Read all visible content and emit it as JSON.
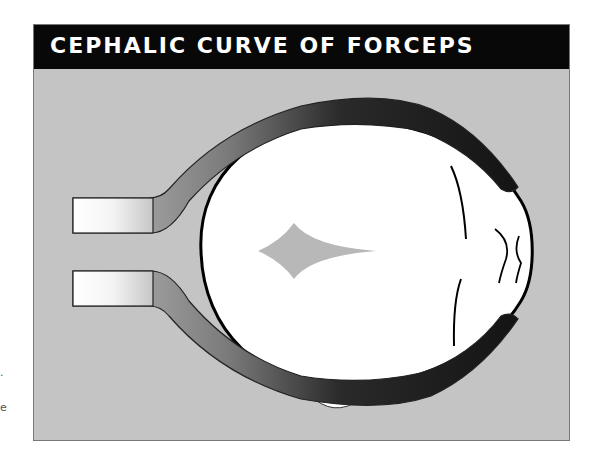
{
  "diagram": {
    "title": "CEPHALIC CURVE OF FORCEPS",
    "parts": {
      "head": "fetal head (top view)",
      "fontanelle": "anterior fontanelle",
      "blade_upper": "upper forceps blade",
      "blade_lower": "lower forceps blade",
      "handle_upper": "upper forceps handle",
      "handle_lower": "lower forceps handle",
      "ear_upper": "ear",
      "ear_lower": "ear"
    },
    "side_fragments": [
      ".",
      "e"
    ],
    "colors": {
      "background": "#c4c4c4",
      "header": "#080808",
      "title": "#ffffff",
      "blade_dark": "#1a1a1a",
      "blade_light": "#bdbdbd",
      "head": "#ffffff",
      "fontanelle": "#b8b8b8"
    }
  }
}
